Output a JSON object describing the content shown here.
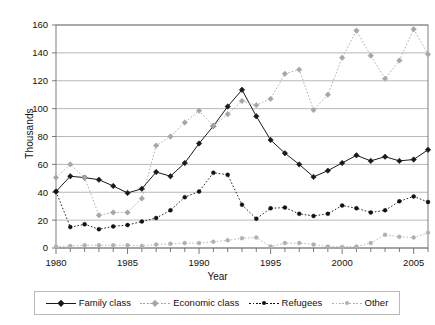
{
  "chart_data": {
    "type": "line",
    "title": "",
    "xlabel": "Year",
    "ylabel": "Thousands",
    "xlim": [
      1980,
      2006
    ],
    "ylim": [
      0,
      160
    ],
    "yticks": [
      0,
      20,
      40,
      60,
      80,
      100,
      120,
      140,
      160
    ],
    "xticks": [
      1980,
      1985,
      1990,
      1995,
      2000,
      2005
    ],
    "xtick_labels": [
      "1980",
      "1985",
      "1990",
      "1995",
      "2000",
      "2005"
    ],
    "ytick_labels": [
      "0",
      "20",
      "40",
      "60",
      "80",
      "100",
      "120",
      "140",
      "160"
    ],
    "grid": "horizontal",
    "legend_position": "bottom",
    "x": [
      1980,
      1981,
      1982,
      1983,
      1984,
      1985,
      1986,
      1987,
      1988,
      1989,
      1990,
      1991,
      1992,
      1993,
      1994,
      1995,
      1996,
      1997,
      1998,
      1999,
      2000,
      2001,
      2002,
      2003,
      2004,
      2005,
      2006
    ],
    "series": [
      {
        "name": "Family class",
        "color": "#1a1a1a",
        "marker": "diamond",
        "linestyle": "solid",
        "values": [
          40.5,
          51.5,
          50.5,
          49.0,
          44.5,
          39.5,
          42.5,
          54.5,
          51.5,
          61.0,
          75.0,
          87.5,
          101.5,
          113.5,
          94.5,
          77.5,
          68.0,
          60.0,
          51.0,
          55.5,
          61.0,
          66.5,
          62.5,
          65.5,
          62.5,
          63.5,
          70.5
        ]
      },
      {
        "name": "Economic class",
        "color": "#a6a6a6",
        "marker": "diamond",
        "linestyle": "dotted",
        "values": [
          50.5,
          60.0,
          50.5,
          23.5,
          25.5,
          25.5,
          35.5,
          73.5,
          80.0,
          90.0,
          98.5,
          87.5,
          96.0,
          105.5,
          102.5,
          107.0,
          125.0,
          128.0,
          99.0,
          110.0,
          136.5,
          156.0,
          138.0,
          121.5,
          134.5,
          157.0,
          139.0
        ]
      },
      {
        "name": "Refugees",
        "color": "#111111",
        "marker": "dot",
        "linestyle": "dotted",
        "values": [
          40.5,
          15.0,
          17.0,
          13.5,
          15.5,
          16.5,
          19.0,
          21.5,
          27.0,
          36.5,
          40.5,
          54.0,
          52.5,
          31.0,
          21.0,
          28.5,
          29.0,
          24.5,
          23.0,
          24.5,
          30.5,
          28.5,
          25.5,
          27.0,
          33.5,
          37.0,
          33.0
        ]
      },
      {
        "name": "Other",
        "color": "#b0b0b0",
        "marker": "dot",
        "linestyle": "dotted",
        "values": [
          1.0,
          1.5,
          2.0,
          2.0,
          2.0,
          2.0,
          1.5,
          2.5,
          3.0,
          3.5,
          3.5,
          4.5,
          5.5,
          7.0,
          7.5,
          1.0,
          3.5,
          3.5,
          2.5,
          1.0,
          0.8,
          1.0,
          3.5,
          9.5,
          8.0,
          7.5,
          11.0
        ]
      }
    ]
  },
  "axis": {
    "y_title": "Thousands",
    "x_title": "Year"
  },
  "legend": {
    "items": [
      {
        "label": "Family class",
        "color": "#1a1a1a",
        "marker": "diamond",
        "style": "solid"
      },
      {
        "label": "Economic class",
        "color": "#a6a6a6",
        "marker": "diamond",
        "style": "dotted"
      },
      {
        "label": "Refugees",
        "color": "#111111",
        "marker": "dot",
        "style": "dotted"
      },
      {
        "label": "Other",
        "color": "#b0b0b0",
        "marker": "dot",
        "style": "dotted"
      }
    ]
  }
}
